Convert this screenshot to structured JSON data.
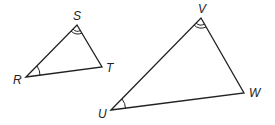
{
  "diagram": {
    "triangle_small": {
      "vertices": {
        "R": "R",
        "S": "S",
        "T": "T"
      },
      "marks": {
        "R": "single arc",
        "S": "double arc"
      }
    },
    "triangle_large": {
      "vertices": {
        "U": "U",
        "V": "V",
        "W": "W"
      },
      "marks": {
        "U": "single arc",
        "V": "double arc"
      }
    },
    "stroke_color": "#222222"
  }
}
